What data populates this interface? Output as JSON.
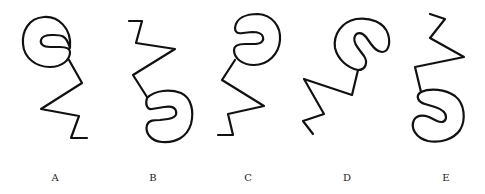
{
  "figures": [
    {
      "label": "A",
      "label_x": 55,
      "description": "C-shape hook at top opening right, zigzag line below"
    },
    {
      "label": "B",
      "label_x": 153,
      "description": "zigzag line at top, hook below opening left"
    },
    {
      "label": "C",
      "label_x": 248,
      "description": "hook at top opening left, zigzag line below"
    },
    {
      "label": "D",
      "label_x": 347,
      "description": "tilted hook at top, zigzag line extending lower-left"
    },
    {
      "label": "E",
      "label_x": 446,
      "description": "zigzag line at top, hook below opening left"
    }
  ],
  "colors": {
    "stroke": "#111111",
    "background": "#ffffff",
    "label": "#222222"
  }
}
